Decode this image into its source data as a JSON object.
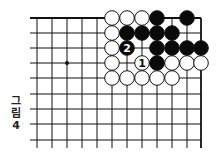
{
  "figure": {
    "caption_lines": [
      "그",
      "림",
      "4"
    ],
    "caption": "그림 4"
  },
  "board": {
    "x_lines": [
      37,
      52,
      67,
      82,
      97,
      112,
      127,
      142,
      157,
      172,
      187,
      201
    ],
    "y_lines": [
      18,
      33,
      48,
      63,
      78,
      94,
      109,
      124,
      140
    ],
    "left_line_start": 30,
    "bottom_extend": 148,
    "top_edge": true,
    "right_edge": true,
    "line_color": "#111111",
    "star_points": [
      [
        67,
        63
      ]
    ],
    "stone_radius": 7.3,
    "stones": [
      {
        "color": "white",
        "x": 112,
        "y": 18
      },
      {
        "color": "white",
        "x": 127,
        "y": 18
      },
      {
        "color": "white",
        "x": 142,
        "y": 18
      },
      {
        "color": "black",
        "x": 157,
        "y": 18
      },
      {
        "color": "black",
        "x": 187,
        "y": 18
      },
      {
        "color": "white",
        "x": 112,
        "y": 33
      },
      {
        "color": "black",
        "x": 127,
        "y": 33
      },
      {
        "color": "black",
        "x": 142,
        "y": 33
      },
      {
        "color": "black",
        "x": 157,
        "y": 33
      },
      {
        "color": "black",
        "x": 172,
        "y": 33
      },
      {
        "color": "white",
        "x": 112,
        "y": 48
      },
      {
        "color": "black",
        "x": 127,
        "y": 48,
        "label": "2"
      },
      {
        "color": "black",
        "x": 157,
        "y": 48
      },
      {
        "color": "black",
        "x": 172,
        "y": 48
      },
      {
        "color": "black",
        "x": 187,
        "y": 48
      },
      {
        "color": "black",
        "x": 201,
        "y": 48
      },
      {
        "color": "white",
        "x": 112,
        "y": 63
      },
      {
        "color": "white",
        "x": 142,
        "y": 63,
        "label": "1"
      },
      {
        "color": "black",
        "x": 157,
        "y": 63
      },
      {
        "color": "white",
        "x": 172,
        "y": 63
      },
      {
        "color": "white",
        "x": 187,
        "y": 63
      },
      {
        "color": "white",
        "x": 201,
        "y": 63
      },
      {
        "color": "white",
        "x": 112,
        "y": 78
      },
      {
        "color": "white",
        "x": 127,
        "y": 78
      },
      {
        "color": "white",
        "x": 142,
        "y": 78
      },
      {
        "color": "white",
        "x": 157,
        "y": 78
      },
      {
        "color": "white",
        "x": 172,
        "y": 78
      }
    ]
  }
}
